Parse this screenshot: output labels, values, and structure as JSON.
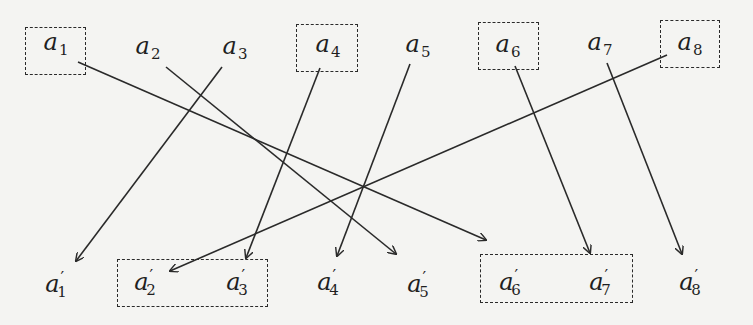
{
  "diagram": {
    "type": "bipartite-mapping",
    "line_color": "#2a2a2a",
    "background": "#f4f4f2",
    "top_nodes": [
      {
        "id": "a1",
        "base": "a",
        "sub": "1",
        "prime": "",
        "x": 56,
        "y": 44,
        "boxed": true
      },
      {
        "id": "a2",
        "base": "a",
        "sub": "2",
        "prime": "",
        "x": 148,
        "y": 48,
        "boxed": false
      },
      {
        "id": "a3",
        "base": "a",
        "sub": "3",
        "prime": "",
        "x": 235,
        "y": 48,
        "boxed": false
      },
      {
        "id": "a4",
        "base": "a",
        "sub": "4",
        "prime": "",
        "x": 328,
        "y": 46,
        "boxed": true
      },
      {
        "id": "a5",
        "base": "a",
        "sub": "5",
        "prime": "",
        "x": 418,
        "y": 46,
        "boxed": false
      },
      {
        "id": "a6",
        "base": "a",
        "sub": "6",
        "prime": "",
        "x": 508,
        "y": 46,
        "boxed": true
      },
      {
        "id": "a7",
        "base": "a",
        "sub": "7",
        "prime": "",
        "x": 600,
        "y": 44,
        "boxed": false
      },
      {
        "id": "a8",
        "base": "a",
        "sub": "8",
        "prime": "",
        "x": 690,
        "y": 44,
        "boxed": true
      }
    ],
    "bottom_nodes": [
      {
        "id": "a1p",
        "base": "a",
        "sub": "1",
        "prime": "′",
        "x": 56,
        "y": 286
      },
      {
        "id": "a2p",
        "base": "a",
        "sub": "2",
        "prime": "′",
        "x": 145,
        "y": 284
      },
      {
        "id": "a3p",
        "base": "a",
        "sub": "3",
        "prime": "′",
        "x": 237,
        "y": 284
      },
      {
        "id": "a4p",
        "base": "a",
        "sub": "4",
        "prime": "′",
        "x": 328,
        "y": 284
      },
      {
        "id": "a5p",
        "base": "a",
        "sub": "5",
        "prime": "′",
        "x": 418,
        "y": 286
      },
      {
        "id": "a6p",
        "base": "a",
        "sub": "6",
        "prime": "′",
        "x": 510,
        "y": 284
      },
      {
        "id": "a7p",
        "base": "a",
        "sub": "7",
        "prime": "′",
        "x": 600,
        "y": 284
      },
      {
        "id": "a8p",
        "base": "a",
        "sub": "8",
        "prime": "′",
        "x": 690,
        "y": 284
      }
    ],
    "top_boxes": [
      {
        "label": "a1-box",
        "x": 25,
        "y": 27,
        "w": 61,
        "h": 48
      },
      {
        "label": "a4-box",
        "x": 296,
        "y": 24,
        "w": 62,
        "h": 48
      },
      {
        "label": "a6-box",
        "x": 478,
        "y": 22,
        "w": 61,
        "h": 48
      },
      {
        "label": "a8-box",
        "x": 660,
        "y": 20,
        "w": 60,
        "h": 48
      }
    ],
    "bottom_boxes": [
      {
        "label": "a2p-a3p-box",
        "x": 117,
        "y": 259,
        "w": 151,
        "h": 48
      },
      {
        "label": "a6p-a7p-box",
        "x": 480,
        "y": 254,
        "w": 153,
        "h": 49
      }
    ],
    "edges": [
      {
        "from": "a1",
        "to": "a6p",
        "x1": 78,
        "y1": 62,
        "x2": 486,
        "y2": 240
      },
      {
        "from": "a2",
        "to": "a5p",
        "x1": 166,
        "y1": 67,
        "x2": 396,
        "y2": 254
      },
      {
        "from": "a3",
        "to": "a1p",
        "x1": 222,
        "y1": 67,
        "x2": 76,
        "y2": 261
      },
      {
        "from": "a4",
        "to": "a3p",
        "x1": 320,
        "y1": 68,
        "x2": 246,
        "y2": 258
      },
      {
        "from": "a5",
        "to": "a4p",
        "x1": 410,
        "y1": 64,
        "x2": 337,
        "y2": 256
      },
      {
        "from": "a6",
        "to": "a7p",
        "x1": 515,
        "y1": 66,
        "x2": 590,
        "y2": 253
      },
      {
        "from": "a7",
        "to": "a8p",
        "x1": 607,
        "y1": 63,
        "x2": 682,
        "y2": 254
      },
      {
        "from": "a8",
        "to": "a2p",
        "x1": 667,
        "y1": 55,
        "x2": 170,
        "y2": 271
      }
    ]
  }
}
